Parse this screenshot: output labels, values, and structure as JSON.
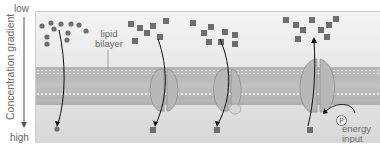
{
  "axis": {
    "low_label": "low",
    "high_label": "high",
    "title": "Concentration gradient"
  },
  "labels": {
    "lipid_bilayer": [
      "lipid",
      "bilayer"
    ],
    "phosphate": "P",
    "energy_input": [
      "energy",
      "input"
    ]
  },
  "colors": {
    "molecule": "#6e6e6e",
    "protein": "#b6b6b6",
    "membrane": "#a8a8a8",
    "arrow": "#111111"
  },
  "scenes": [
    {
      "id": "simple-diffusion",
      "molecule_shape": "circle",
      "channel": false
    },
    {
      "id": "channel-diffusion",
      "molecule_shape": "square",
      "channel": true
    },
    {
      "id": "carrier-diffusion",
      "molecule_shape": "square",
      "channel": true,
      "bound_molecule": true
    },
    {
      "id": "active-transport",
      "molecule_shape": "square",
      "channel": true,
      "energy": true
    }
  ]
}
